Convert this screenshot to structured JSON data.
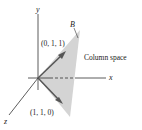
{
  "axes": {
    "x": "x",
    "y": "y",
    "z": "z"
  },
  "plane_label": "B",
  "region_label": "Column space",
  "vectors": [
    {
      "label": "(0, 1, 1)"
    },
    {
      "label": "(1, 1, 0)"
    }
  ],
  "colors": {
    "plane": "#d4d4d4",
    "arrow": "#555555",
    "axis": "#333333"
  }
}
